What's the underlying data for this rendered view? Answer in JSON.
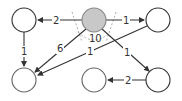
{
  "diagram": {
    "type": "directed-graph",
    "colors": {
      "node_stroke": "#333333",
      "node_fill": "#ffffff",
      "highlight_fill": "#c8c8c8",
      "edge": "#333333",
      "dashed": "#999999",
      "label": "#333333"
    },
    "nodes": [
      {
        "id": "top-left",
        "x": 24,
        "y": 20,
        "r": 12,
        "highlighted": false
      },
      {
        "id": "center",
        "x": 94,
        "y": 20,
        "r": 12,
        "highlighted": true
      },
      {
        "id": "top-right",
        "x": 158,
        "y": 20,
        "r": 12,
        "highlighted": false
      },
      {
        "id": "bottom-left",
        "x": 24,
        "y": 80,
        "r": 12,
        "highlighted": false
      },
      {
        "id": "bottom-middle",
        "x": 94,
        "y": 80,
        "r": 12,
        "highlighted": false
      },
      {
        "id": "bottom-right",
        "x": 158,
        "y": 80,
        "r": 12,
        "highlighted": false
      }
    ],
    "edges": [
      {
        "from": "center",
        "to": "top-left",
        "label": "2"
      },
      {
        "from": "center",
        "to": "top-right",
        "label": "1"
      },
      {
        "from": "center",
        "to": "bottom-left",
        "label": "6"
      },
      {
        "from": "center",
        "to": "bottom-right",
        "label": "1"
      },
      {
        "from": "top-left",
        "to": "bottom-left",
        "label": "1"
      },
      {
        "from": "top-right",
        "to": "bottom-left",
        "label": "1"
      },
      {
        "from": "bottom-right",
        "to": "bottom-middle",
        "label": "2"
      }
    ],
    "annotation": {
      "label": "10",
      "description": "dashed angle arc under center node"
    }
  }
}
